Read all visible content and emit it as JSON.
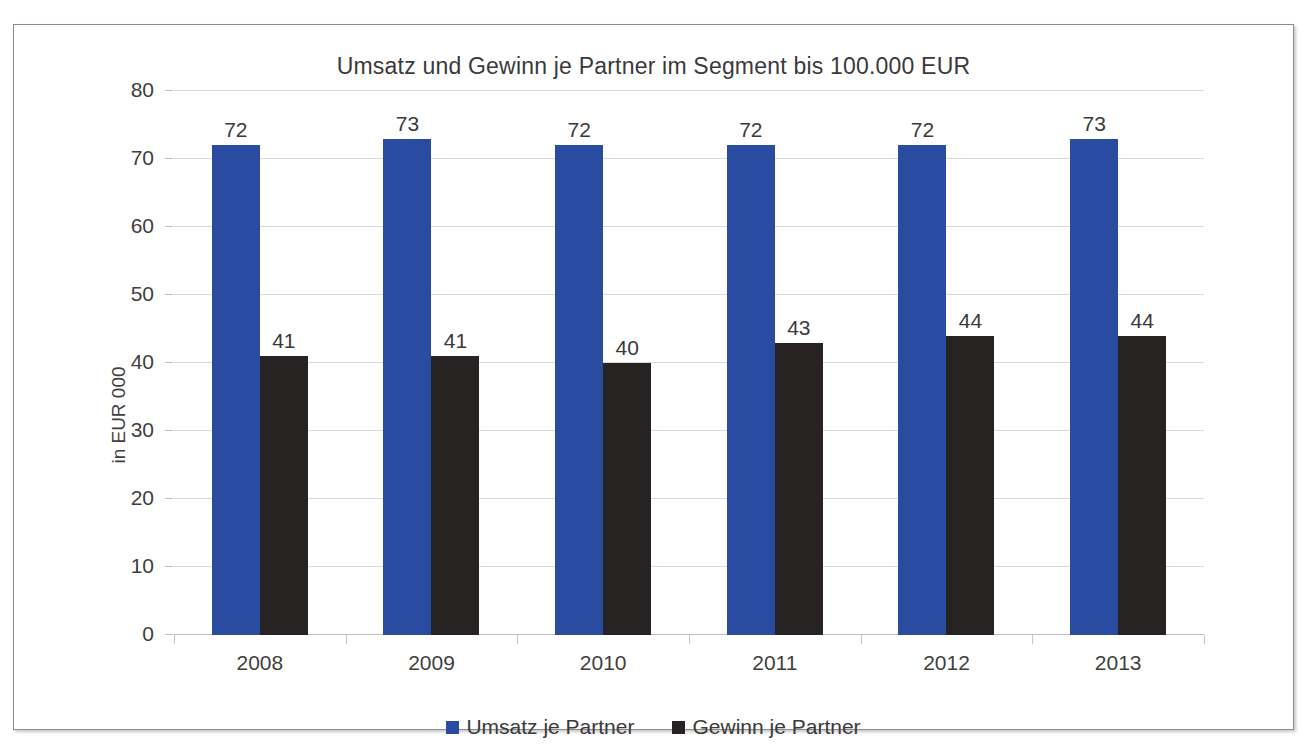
{
  "chart_data": {
    "type": "bar",
    "title": "Umsatz und Gewinn je Partner im Segment bis 100.000 EUR",
    "xlabel": "",
    "ylabel": "in EUR 000",
    "categories": [
      "2008",
      "2009",
      "2010",
      "2011",
      "2012",
      "2013"
    ],
    "series": [
      {
        "name": "Umsatz je Partner",
        "color": "#2a4ca0",
        "values": [
          72,
          73,
          72,
          72,
          72,
          73
        ],
        "labels": [
          "72",
          "73",
          "72",
          "72",
          "72",
          "73"
        ]
      },
      {
        "name": "Gewinn je Partner",
        "color": "#262322",
        "values": [
          41,
          41,
          40,
          43,
          44,
          44
        ],
        "labels": [
          "41",
          "41",
          "40",
          "43",
          "44",
          "44"
        ]
      }
    ],
    "ylim": [
      0,
      80
    ],
    "ytick_values": [
      0,
      10,
      20,
      30,
      40,
      50,
      60,
      70,
      80
    ],
    "ytick_labels": [
      "0",
      "10",
      "20",
      "30",
      "40",
      "50",
      "60",
      "70",
      "80"
    ],
    "grid": true,
    "legend_position": "bottom",
    "data_labels": true
  }
}
